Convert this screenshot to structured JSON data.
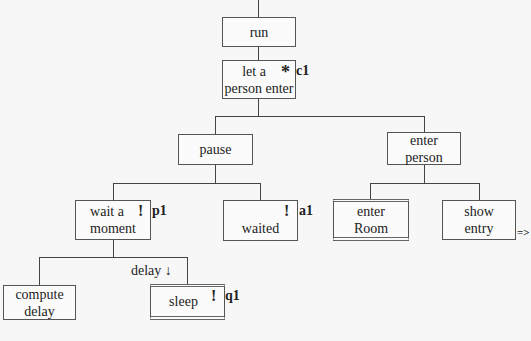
{
  "diagram": {
    "type": "jackson-structure-tree",
    "nodes": [
      {
        "id": "run",
        "lines": [
          "run"
        ]
      },
      {
        "id": "let-person-enter",
        "lines": [
          "let a",
          "person enter"
        ],
        "marker": "*",
        "tag": "c1"
      },
      {
        "id": "pause",
        "lines": [
          "pause"
        ]
      },
      {
        "id": "enter-person",
        "lines": [
          "enter",
          "person"
        ]
      },
      {
        "id": "wait-moment",
        "lines": [
          "wait a",
          "moment"
        ],
        "marker": "!",
        "tag": "p1"
      },
      {
        "id": "waited",
        "lines": [
          "waited"
        ],
        "marker": "!",
        "tag": "a1"
      },
      {
        "id": "enter-room",
        "lines": [
          "enter",
          "Room"
        ],
        "style": "double"
      },
      {
        "id": "show-entry",
        "lines": [
          "show",
          "entry"
        ],
        "continuation": "=>"
      },
      {
        "id": "compute-delay",
        "lines": [
          "compute",
          "delay"
        ]
      },
      {
        "id": "sleep",
        "lines": [
          "sleep"
        ],
        "marker": "!",
        "tag": "q1",
        "style": "double"
      }
    ],
    "edges": [
      {
        "from": "run",
        "to": "let-person-enter"
      },
      {
        "from": "let-person-enter",
        "to": "pause"
      },
      {
        "from": "let-person-enter",
        "to": "enter-person"
      },
      {
        "from": "pause",
        "to": "wait-moment"
      },
      {
        "from": "pause",
        "to": "waited"
      },
      {
        "from": "enter-person",
        "to": "enter-room"
      },
      {
        "from": "enter-person",
        "to": "show-entry"
      },
      {
        "from": "wait-moment",
        "to": "compute-delay"
      },
      {
        "from": "wait-moment",
        "to": "sleep",
        "label": "delay ↓"
      }
    ]
  }
}
